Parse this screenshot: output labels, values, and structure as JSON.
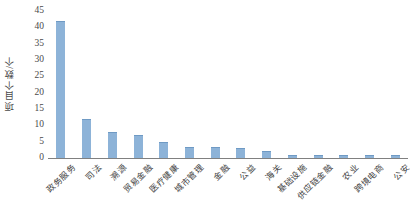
{
  "chart_data": {
    "type": "bar",
    "title": "",
    "xlabel": "",
    "ylabel": "项目个数/个",
    "ylim": [
      0,
      45
    ],
    "ytick_step": 5,
    "yticks": [
      45,
      40,
      35,
      30,
      25,
      20,
      15,
      10,
      5,
      0
    ],
    "grid": false,
    "legend": "none",
    "bar_color": "#8db3d8",
    "axis_color": "#808080",
    "categories": [
      "政务服务",
      "司法",
      "溯源",
      "贸易金融",
      "医疗健康",
      "城市管理",
      "金融",
      "公益",
      "海关",
      "基础设施",
      "供应链金融",
      "农业",
      "跨境电商",
      "公安"
    ],
    "values": [
      42,
      12,
      8,
      7,
      5,
      3.5,
      3.5,
      3,
      2,
      1,
      1,
      1,
      1,
      1
    ]
  }
}
